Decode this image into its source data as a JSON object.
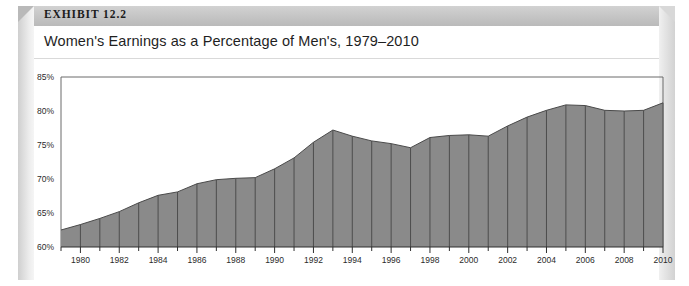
{
  "exhibit": {
    "label": "EXHIBIT 12.2",
    "title": "Women's Earnings as a Percentage of Men's, 1979–2010"
  },
  "colors": {
    "area_fill": "#8a8a8a",
    "area_stroke": "#4a4a4a",
    "grid_line": "#3a3a3a",
    "axis": "#6b6b6b",
    "frame_band": "#c3c3c3",
    "text": "#1f1f1f"
  },
  "source_note": "",
  "chart_data": {
    "type": "area",
    "title": "Women's Earnings as a Percentage of Men's, 1979–2010",
    "xlabel": "",
    "ylabel": "",
    "ylim": [
      60,
      85
    ],
    "ytick_labels": [
      "85%",
      "80%",
      "75%",
      "70%",
      "65%",
      "60%"
    ],
    "yticks": [
      85,
      80,
      75,
      70,
      65,
      60
    ],
    "xlim": [
      1979,
      2010
    ],
    "xtick_labels": [
      "1980",
      "1982",
      "1984",
      "1986",
      "1988",
      "1990",
      "1992",
      "1994",
      "1996",
      "1998",
      "2000",
      "2002",
      "2004",
      "2006",
      "2008",
      "2010"
    ],
    "xticks_labeled": [
      1980,
      1982,
      1984,
      1986,
      1988,
      1990,
      1992,
      1994,
      1996,
      1998,
      2000,
      2002,
      2004,
      2006,
      2008,
      2010
    ],
    "grid": "vertical-yearly",
    "legend": "none",
    "x": [
      1979,
      1980,
      1981,
      1982,
      1983,
      1984,
      1985,
      1986,
      1987,
      1988,
      1989,
      1990,
      1991,
      1992,
      1993,
      1994,
      1995,
      1996,
      1997,
      1998,
      1999,
      2000,
      2001,
      2002,
      2003,
      2004,
      2005,
      2006,
      2007,
      2008,
      2009,
      2010
    ],
    "values": [
      62.5,
      63.3,
      64.2,
      65.2,
      66.5,
      67.6,
      68.1,
      69.3,
      69.9,
      70.1,
      70.2,
      71.5,
      73.1,
      75.4,
      77.2,
      76.3,
      75.6,
      75.2,
      74.6,
      76.1,
      76.4,
      76.5,
      76.3,
      77.8,
      79.1,
      80.1,
      80.9,
      80.8,
      80.1,
      80.0,
      80.1,
      81.2
    ],
    "units": "percent"
  }
}
